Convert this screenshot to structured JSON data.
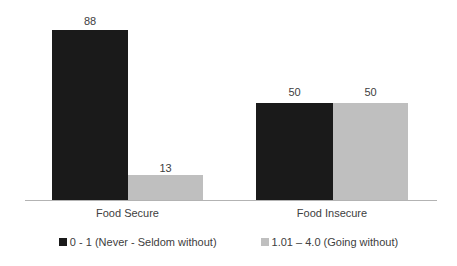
{
  "chart_data": {
    "type": "bar",
    "title": "",
    "subtitle": "",
    "xlabel": "",
    "ylabel": "",
    "ylim": [
      0,
      103
    ],
    "grid": false,
    "legend_position": "bottom",
    "categories": [
      "Food Secure",
      "Food Insecure"
    ],
    "series": [
      {
        "name": "0 - 1 (Never - Seldom without)",
        "color": "#1a1a1a",
        "values": [
          88,
          50
        ],
        "labels": [
          "88",
          "50"
        ]
      },
      {
        "name": "1.01 – 4.0 (Going without)",
        "color": "#bfbfbf",
        "values": [
          13,
          50
        ],
        "labels": [
          "13",
          "50"
        ]
      }
    ],
    "axis_color": "#b3b3b3"
  },
  "legend": {
    "items": [
      {
        "label": "0 - 1 (Never - Seldom without)",
        "swatch": "legend-swatch-black"
      },
      {
        "label": "1.01 – 4.0 (Going without)",
        "swatch": "legend-swatch-gray"
      }
    ]
  }
}
